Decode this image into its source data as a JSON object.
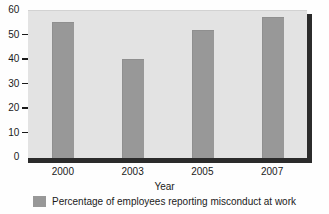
{
  "chart_data": {
    "type": "bar",
    "title": "",
    "categories": [
      "2000",
      "2003",
      "2005",
      "2007"
    ],
    "values": [
      55,
      40,
      52,
      57
    ],
    "series": [
      {
        "name": "Percentage of employees reporting misconduct at work",
        "values": [
          55,
          40,
          52,
          57
        ]
      }
    ],
    "xlabel": "Year",
    "ylabel": "",
    "ylim": [
      0,
      60
    ],
    "yticks": [
      0,
      10,
      20,
      30,
      40,
      50,
      60
    ],
    "ytick_labels": [
      "0",
      "10",
      "20",
      "30",
      "40",
      "50",
      "60"
    ],
    "grid": false,
    "legend_position": "bottom",
    "bar_color": "#989898",
    "plot_background": "#e3e3e3",
    "axis_color": "#2b2b2b"
  },
  "legend": {
    "entries": [
      {
        "label": "Percentage of employees reporting misconduct at work",
        "color": "#989898"
      }
    ]
  },
  "axes": {
    "x_title": "Year"
  }
}
